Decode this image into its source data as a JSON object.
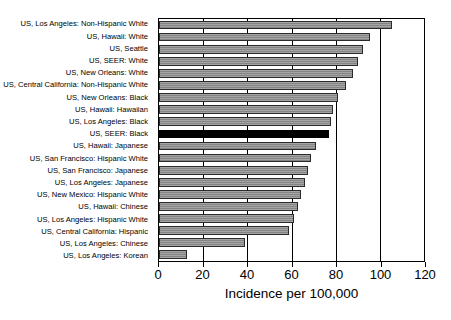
{
  "chart_data": {
    "type": "bar",
    "orientation": "horizontal",
    "title": "",
    "xlabel": "Incidence per 100,000",
    "ylabel": "",
    "xlim": [
      0,
      120
    ],
    "xticks": [
      0,
      20,
      40,
      60,
      80,
      100,
      120
    ],
    "grid": true,
    "grid_axis": "x",
    "legend": "none",
    "bar_color": "#8c8c8c",
    "highlight_color": "#000000",
    "highlight_category": "US, SEER: Black",
    "categories": [
      "US, Los Angeles: Non-Hispanic White",
      "US, Hawaii: White",
      "US, Seattle",
      "US, SEER: White",
      "US, New Orleans: White",
      "US, Central California: Non-Hispanic White",
      "US, New Orleans: Black",
      "US, Hawaii: Hawaiian",
      "US, Los Angeles: Black",
      "US, SEER: Black",
      "US, Hawaii: Japanese",
      "US, San Francisco: Hispanic White",
      "US, San Francisco: Japanese",
      "US, Los Angeles: Japanese",
      "US, New Mexico: Hispanic White",
      "US, Hawaii: Chinese",
      "US, Los Angeles: Hispanic White",
      "US, Central California: Hispanic",
      "US, Los Angeles: Chinese",
      "US, Los Angeles: Korean"
    ],
    "values": [
      105.5,
      95.5,
      92.5,
      90.0,
      88.0,
      84.5,
      81.0,
      79.0,
      78.0,
      77.0,
      71.0,
      69.0,
      67.5,
      66.0,
      64.5,
      63.0,
      61.0,
      59.0,
      39.0,
      12.5
    ]
  }
}
